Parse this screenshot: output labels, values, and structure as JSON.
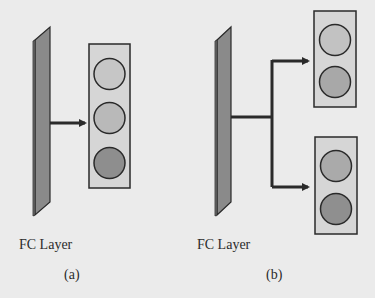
{
  "figure": {
    "panels": [
      {
        "id": "a",
        "layer_label": "FC Layer",
        "caption": "(a)",
        "output_groups": [
          {
            "nodes": 3,
            "node_colors": [
              "#c6c6c6",
              "#b9b9b9",
              "#8e8e8e"
            ]
          }
        ]
      },
      {
        "id": "b",
        "layer_label": "FC Layer",
        "caption": "(b)",
        "output_groups": [
          {
            "nodes": 2,
            "node_colors": [
              "#c2c2c2",
              "#a8a8a8"
            ]
          },
          {
            "nodes": 2,
            "node_colors": [
              "#aaaaaa",
              "#8f8f8f"
            ]
          }
        ]
      }
    ],
    "colors": {
      "background": "#ebebeb",
      "fc_layer_fill": "#8a8a8a",
      "box_fill": "#d6d6d6",
      "stroke": "#2a2a2a"
    }
  }
}
